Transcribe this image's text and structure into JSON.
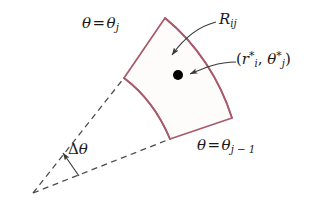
{
  "figure": {
    "background_color": "#ffffff",
    "curve_color": "#a85a6a",
    "guide_color": "#4a4a4a",
    "text_color": "#1a1a1a",
    "point_color": "#000000",
    "width": 316,
    "height": 212
  },
  "labels": {
    "theta_upper": {
      "theta": "θ",
      "equals": "=",
      "theta2": "θ",
      "subscript": "j"
    },
    "theta_lower": {
      "theta": "θ",
      "equals": "=",
      "theta2": "θ",
      "subscript": "j − 1"
    },
    "region": {
      "symbol": "R",
      "subscript": "ij"
    },
    "sample_point": {
      "open_paren": "(",
      "r": "r",
      "r_star": "*",
      "r_sub": "i",
      "comma": ",",
      "theta": "θ",
      "theta_star": "*",
      "theta_sub": "j",
      "close_paren": ")"
    },
    "delta_theta": {
      "delta": "Δ",
      "theta": "θ"
    }
  },
  "geometry": {
    "apex": [
      33,
      193
    ],
    "corner_top": [
      165,
      18
    ],
    "corner_left": [
      124,
      78
    ],
    "corner_bottom": [
      170,
      139
    ],
    "corner_right": [
      232,
      118
    ],
    "sample_point_dot": [
      178,
      75
    ],
    "dot_radius": 5
  }
}
